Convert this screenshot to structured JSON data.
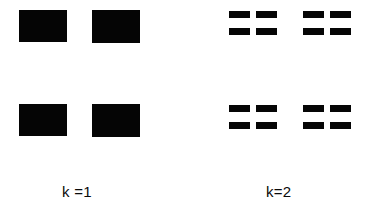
{
  "figure": {
    "width": 375,
    "height": 218,
    "background_color": "#ffffff",
    "ink_color": "#050505"
  },
  "groups": [
    {
      "id": "k1",
      "label": "k =1",
      "label_x": 62,
      "label_y": 184,
      "subdivision": 1,
      "blocks": [
        {
          "x": 19,
          "y": 10,
          "w": 48,
          "h": 32
        },
        {
          "x": 92,
          "y": 10,
          "w": 48,
          "h": 33
        },
        {
          "x": 19,
          "y": 104,
          "w": 48,
          "h": 32
        },
        {
          "x": 92,
          "y": 104,
          "w": 48,
          "h": 33
        }
      ]
    },
    {
      "id": "k2",
      "label": "k=2",
      "label_x": 266,
      "label_y": 184,
      "subdivision": 2,
      "bar_w": 21,
      "bar_h": 7,
      "col_gap": 6,
      "row_gap": 10,
      "blocks": [
        {
          "x": 229,
          "y": 11,
          "w": 48,
          "h": 24
        },
        {
          "x": 303,
          "y": 11,
          "w": 48,
          "h": 24
        },
        {
          "x": 229,
          "y": 105,
          "w": 48,
          "h": 24
        },
        {
          "x": 303,
          "y": 105,
          "w": 48,
          "h": 24
        }
      ]
    }
  ]
}
